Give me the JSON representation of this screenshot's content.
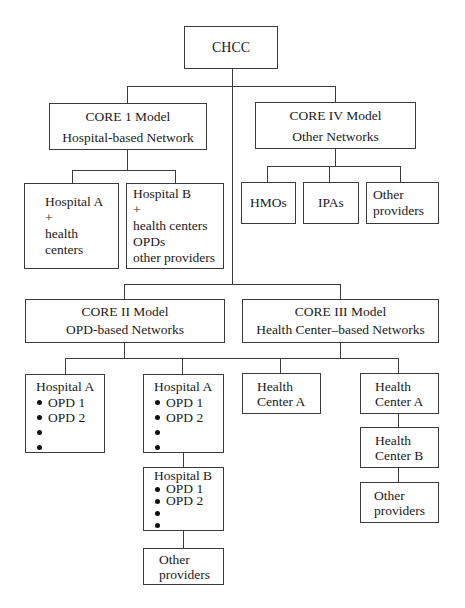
{
  "root": {
    "label": "CHCC"
  },
  "core1": {
    "title": "CORE 1 Model",
    "subtitle": "Hospital-based Network",
    "children": [
      {
        "lines": [
          "Hospital A",
          "+",
          "health",
          "centers"
        ]
      },
      {
        "lines": [
          "Hospital B",
          "+",
          "health centers",
          "OPDs",
          "other providers"
        ]
      }
    ]
  },
  "core4": {
    "title": "CORE IV Model",
    "subtitle": "Other Networks",
    "children": [
      {
        "lines": [
          "HMOs"
        ]
      },
      {
        "lines": [
          "IPAs"
        ]
      },
      {
        "lines": [
          "Other",
          "providers"
        ]
      }
    ]
  },
  "core2": {
    "title": "CORE II Model",
    "subtitle": "OPD-based Networks",
    "children": [
      {
        "title": "Hospital A",
        "items": [
          "OPD 1",
          "OPD 2",
          "",
          ""
        ]
      },
      {
        "title": "Hospital A",
        "items": [
          "OPD 1",
          "OPD 2",
          "",
          ""
        ]
      },
      {
        "title": "Hospital B",
        "items": [
          "OPD 1",
          "OPD 2",
          "",
          ""
        ]
      },
      {
        "lines": [
          "Other",
          "providers"
        ]
      }
    ]
  },
  "core3": {
    "title": "CORE III Model",
    "subtitle": "Health Center–based Networks",
    "children": [
      {
        "lines": [
          "Health",
          "Center A"
        ]
      },
      {
        "lines": [
          "Health",
          "Center A"
        ]
      },
      {
        "lines": [
          "Health",
          "Center B"
        ]
      },
      {
        "lines": [
          "Other",
          "providers"
        ]
      }
    ]
  }
}
